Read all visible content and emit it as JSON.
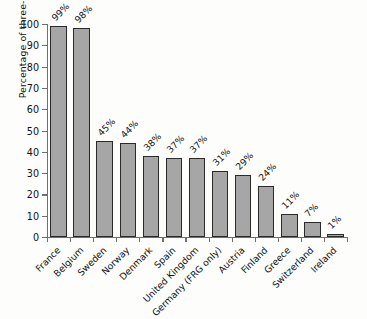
{
  "chart_data": {
    "type": "bar",
    "title": "",
    "xlabel": "",
    "ylabel": "Percentage of three-year-olds",
    "ylim": [
      0,
      100
    ],
    "yticks": [
      0,
      10,
      20,
      30,
      40,
      50,
      60,
      70,
      80,
      90,
      100
    ],
    "ytick_labels": [
      "0",
      "10",
      "20",
      "30",
      "40",
      "50",
      "60",
      "70",
      "80",
      "90",
      "100"
    ],
    "grid": false,
    "legend": "none",
    "categories": [
      "France",
      "Belgium",
      "Sweden",
      "Norway",
      "Denmark",
      "Spain",
      "United Kingdom",
      "Germany (FRG only)",
      "Austria",
      "Finland",
      "Greece",
      "Switzerland",
      "Ireland"
    ],
    "values": [
      99,
      98,
      45,
      44,
      38,
      37,
      37,
      31,
      29,
      24,
      11,
      7,
      1
    ],
    "data_labels": [
      "99%",
      "98%",
      "45%",
      "44%",
      "38%",
      "37%",
      "37%",
      "31%",
      "29%",
      "24%",
      "11%",
      "7%",
      "1%"
    ],
    "colors": {
      "bar_fill": "#a6a6a6",
      "bar_edge": "#2a2a2a",
      "axis": "#6f6f6f",
      "text": "#111111",
      "background": "#fdfdfc"
    }
  }
}
